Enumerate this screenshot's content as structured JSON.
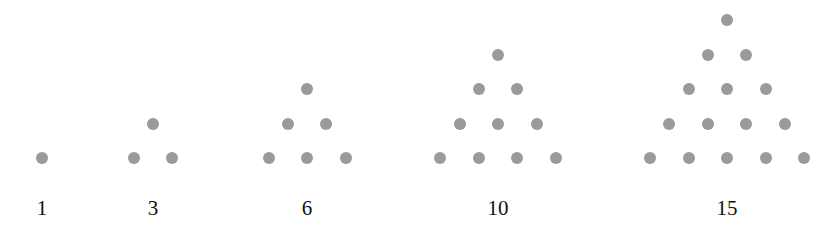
{
  "dot_color": "#9a9a9a",
  "figures": [
    {
      "label": "1",
      "rows": 1,
      "center_x": 42
    },
    {
      "label": "3",
      "rows": 2,
      "center_x": 153
    },
    {
      "label": "6",
      "rows": 3,
      "center_x": 307
    },
    {
      "label": "10",
      "rows": 4,
      "center_x": 498
    },
    {
      "label": "15",
      "rows": 5,
      "center_x": 727
    }
  ]
}
